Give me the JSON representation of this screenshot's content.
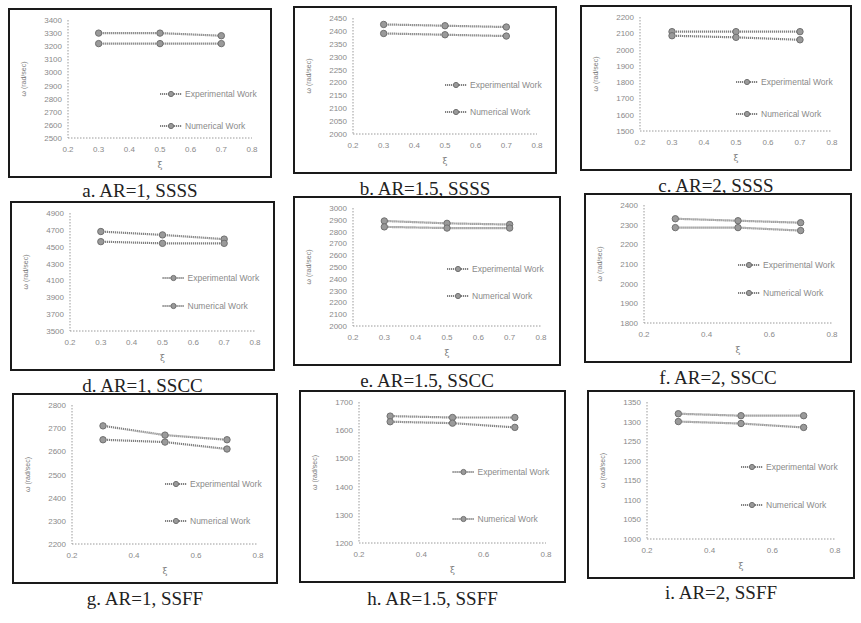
{
  "figure": {
    "legend": {
      "experimental": "Experimental Work",
      "numerical": "Numerical Work"
    },
    "ylabel": "ω (rad/sec)",
    "xlabel": "ξ"
  },
  "chart_data": [
    {
      "id": "a",
      "type": "line",
      "title": "a. AR=1, SSSS",
      "xlabel": "ξ",
      "ylabel": "ω (rad/sec)",
      "xlim": [
        0.2,
        0.8
      ],
      "xticks": [
        0.2,
        0.3,
        0.4,
        0.5,
        0.6,
        0.7,
        0.8
      ],
      "ylim": [
        2500,
        3400
      ],
      "yticks": [
        2500,
        2600,
        2700,
        2800,
        2900,
        3000,
        3100,
        3200,
        3300,
        3400
      ],
      "x": [
        0.3,
        0.5,
        0.7
      ],
      "series": [
        {
          "name": "Experimental Work",
          "values": [
            3300,
            3300,
            3280
          ]
        },
        {
          "name": "Numerical Work",
          "values": [
            3220,
            3220,
            3220
          ]
        }
      ],
      "grid": false,
      "legend_position": "inside-right"
    },
    {
      "id": "b",
      "type": "line",
      "title": "b. AR=1.5, SSSS",
      "xlabel": "ξ",
      "ylabel": "ω (rad/sec)",
      "xlim": [
        0.2,
        0.8
      ],
      "xticks": [
        0.2,
        0.3,
        0.4,
        0.5,
        0.6,
        0.7,
        0.8
      ],
      "ylim": [
        2000,
        2450
      ],
      "yticks": [
        2000,
        2050,
        2100,
        2150,
        2200,
        2250,
        2300,
        2350,
        2400,
        2450
      ],
      "x": [
        0.3,
        0.5,
        0.7
      ],
      "series": [
        {
          "name": "Experimental Work",
          "values": [
            2425,
            2420,
            2415
          ]
        },
        {
          "name": "Numerical Work",
          "values": [
            2390,
            2385,
            2380
          ]
        }
      ],
      "grid": false,
      "legend_position": "inside-right"
    },
    {
      "id": "c",
      "type": "line",
      "title": "c. AR=2, SSSS",
      "xlabel": "ξ",
      "ylabel": "ω (rad/sec)",
      "xlim": [
        0.2,
        0.8
      ],
      "xticks": [
        0.2,
        0.3,
        0.4,
        0.5,
        0.6,
        0.7,
        0.8
      ],
      "ylim": [
        1500,
        2200
      ],
      "yticks": [
        1500,
        1600,
        1700,
        1800,
        1900,
        2000,
        2100,
        2200
      ],
      "x": [
        0.3,
        0.5,
        0.7
      ],
      "series": [
        {
          "name": "Experimental Work",
          "values": [
            2110,
            2110,
            2110
          ]
        },
        {
          "name": "Numerical Work",
          "values": [
            2085,
            2075,
            2060
          ]
        }
      ],
      "grid": false,
      "legend_position": "inside-right"
    },
    {
      "id": "d",
      "type": "line",
      "title": "d. AR=1, SSCC",
      "xlabel": "ξ",
      "ylabel": "ω (rad/sec)",
      "xlim": [
        0.2,
        0.8
      ],
      "xticks": [
        0.2,
        0.3,
        0.4,
        0.5,
        0.6,
        0.7,
        0.8
      ],
      "ylim": [
        3500,
        4900
      ],
      "yticks": [
        3500,
        3700,
        3900,
        4100,
        4300,
        4500,
        4700,
        4900
      ],
      "x": [
        0.3,
        0.5,
        0.7
      ],
      "series": [
        {
          "name": "Experimental Work",
          "values": [
            4680,
            4640,
            4590
          ]
        },
        {
          "name": "Numerical Work",
          "values": [
            4560,
            4540,
            4540
          ]
        }
      ],
      "grid": false,
      "legend_position": "inside-right"
    },
    {
      "id": "e",
      "type": "line",
      "title": "e. AR=1.5, SSCC",
      "xlabel": "ξ",
      "ylabel": "ω (rad/sec)",
      "xlim": [
        0.2,
        0.8
      ],
      "xticks": [
        0.2,
        0.3,
        0.4,
        0.5,
        0.6,
        0.7,
        0.8
      ],
      "ylim": [
        2000,
        3000
      ],
      "yticks": [
        2000,
        2100,
        2200,
        2300,
        2400,
        2500,
        2600,
        2700,
        2800,
        2900,
        3000
      ],
      "x": [
        0.3,
        0.5,
        0.7
      ],
      "series": [
        {
          "name": "Experimental Work",
          "values": [
            2890,
            2870,
            2860
          ]
        },
        {
          "name": "Numerical Work",
          "values": [
            2840,
            2830,
            2830
          ]
        }
      ],
      "grid": false,
      "legend_position": "inside-right"
    },
    {
      "id": "f",
      "type": "line",
      "title": "f. AR=2, SSCC",
      "xlabel": "ξ",
      "ylabel": "ω (rad/sec)",
      "xlim": [
        0.2,
        0.8
      ],
      "xticks": [
        0.2,
        0.4,
        0.6,
        0.8
      ],
      "ylim": [
        1800,
        2400
      ],
      "yticks": [
        1800,
        1900,
        2000,
        2100,
        2200,
        2300,
        2400
      ],
      "x": [
        0.3,
        0.5,
        0.7
      ],
      "series": [
        {
          "name": "Experimental Work",
          "values": [
            2330,
            2320,
            2310
          ]
        },
        {
          "name": "Numerical Work",
          "values": [
            2285,
            2285,
            2270
          ]
        }
      ],
      "grid": false,
      "legend_position": "inside-right"
    },
    {
      "id": "g",
      "type": "line",
      "title": "g. AR=1, SSFF",
      "xlabel": "ξ",
      "ylabel": "ω (rad/sec)",
      "xlim": [
        0.2,
        0.8
      ],
      "xticks": [
        0.2,
        0.4,
        0.6,
        0.8
      ],
      "ylim": [
        2200,
        2800
      ],
      "yticks": [
        2200,
        2300,
        2400,
        2500,
        2600,
        2700,
        2800
      ],
      "x": [
        0.3,
        0.5,
        0.7
      ],
      "series": [
        {
          "name": "Experimental Work",
          "values": [
            2710,
            2670,
            2650
          ]
        },
        {
          "name": "Numerical Work",
          "values": [
            2650,
            2640,
            2610
          ]
        }
      ],
      "grid": false,
      "legend_position": "inside-right"
    },
    {
      "id": "h",
      "type": "line",
      "title": "h. AR=1.5, SSFF",
      "xlabel": "ξ",
      "ylabel": "ω (rad/sec)",
      "xlim": [
        0.2,
        0.8
      ],
      "xticks": [
        0.2,
        0.4,
        0.6,
        0.8
      ],
      "ylim": [
        1200,
        1700
      ],
      "yticks": [
        1200,
        1300,
        1400,
        1500,
        1600,
        1700
      ],
      "x": [
        0.3,
        0.5,
        0.7
      ],
      "series": [
        {
          "name": "Experimental Work",
          "values": [
            1650,
            1645,
            1645
          ]
        },
        {
          "name": "Numerical Work",
          "values": [
            1630,
            1625,
            1610
          ]
        }
      ],
      "grid": false,
      "legend_position": "inside-right"
    },
    {
      "id": "i",
      "type": "line",
      "title": "i. AR=2, SSFF",
      "xlabel": "ξ",
      "ylabel": "ω (rad/sec)",
      "xlim": [
        0.2,
        0.8
      ],
      "xticks": [
        0.2,
        0.4,
        0.6,
        0.8
      ],
      "ylim": [
        1000,
        1350
      ],
      "yticks": [
        1000,
        1050,
        1100,
        1150,
        1200,
        1250,
        1300,
        1350
      ],
      "x": [
        0.3,
        0.5,
        0.7
      ],
      "series": [
        {
          "name": "Experimental Work",
          "values": [
            1320,
            1315,
            1315
          ]
        },
        {
          "name": "Numerical Work",
          "values": [
            1300,
            1295,
            1285
          ]
        }
      ],
      "grid": false,
      "legend_position": "inside-right"
    }
  ],
  "layout": {
    "panels": [
      {
        "frame": [
          8,
          8,
          264,
          170
        ],
        "caption_y": 180,
        "legend_y": [
          84,
          116
        ]
      },
      {
        "frame": [
          293,
          6,
          264,
          168
        ],
        "caption_y": 178,
        "legend_y": [
          77,
          104
        ]
      },
      {
        "frame": [
          580,
          5,
          272,
          166
        ],
        "caption_y": 175,
        "legend_y": [
          75,
          107
        ]
      },
      {
        "frame": [
          10,
          201,
          265,
          170
        ],
        "caption_y": 375,
        "legend_y": [
          75,
          103
        ]
      },
      {
        "frame": [
          293,
          196,
          268,
          170
        ],
        "caption_y": 370,
        "legend_y": [
          71,
          98
        ]
      },
      {
        "frame": [
          584,
          193,
          268,
          170
        ],
        "caption_y": 367,
        "legend_y": [
          70,
          98
        ]
      },
      {
        "frame": [
          12,
          393,
          266,
          191
        ],
        "caption_y": 588,
        "legend_y": [
          89,
          126
        ]
      },
      {
        "frame": [
          299,
          390,
          267,
          193
        ],
        "caption_y": 588,
        "legend_y": [
          80,
          127
        ]
      },
      {
        "frame": [
          587,
          390,
          268,
          189
        ],
        "caption_y": 582,
        "legend_y": [
          75,
          113
        ]
      }
    ]
  }
}
